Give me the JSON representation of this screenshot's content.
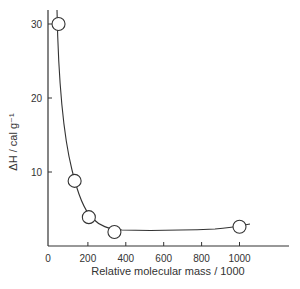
{
  "chart_data": {
    "type": "scatter",
    "title": "",
    "xlabel": "Relative molecular mass / 1000",
    "ylabel": "ΔH / cal g⁻¹",
    "xlim": [
      0,
      1200
    ],
    "ylim": [
      0,
      32
    ],
    "x_ticks": [
      0,
      200,
      400,
      600,
      800,
      1000
    ],
    "x_tick_labels": [
      "0",
      "200",
      "400",
      "600",
      "800",
      "1000"
    ],
    "y_ticks": [
      10,
      20,
      30
    ],
    "y_tick_labels": [
      "10",
      "20",
      "30"
    ],
    "grid": false,
    "legend": null,
    "series": [
      {
        "name": "measured",
        "marker": "open-circle",
        "x": [
          45,
          130,
          205,
          340,
          1000
        ],
        "y": [
          30,
          8.8,
          3.9,
          1.9,
          2.6
        ]
      }
    ],
    "fitted_curve": {
      "style": "smooth line",
      "description": "Smooth curve falling steeply from ~32 at x≈40 through the points, reaching a minimum of ~2.3 near x≈500, then rising slightly to ~2.9 at x≈1050"
    }
  }
}
